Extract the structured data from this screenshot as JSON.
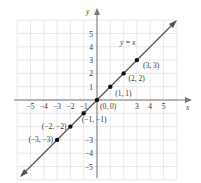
{
  "chart_data": {
    "type": "line",
    "title": "",
    "equation_label": "y = x",
    "xlabel": "x",
    "ylabel": "y",
    "xlim": [
      -6,
      6
    ],
    "ylim": [
      -6,
      6
    ],
    "grid": true,
    "x_ticks": [
      "-5",
      "-4",
      "-3",
      "-2",
      "-1",
      "3",
      "4",
      "5"
    ],
    "y_ticks": [
      "5",
      "4",
      "3",
      "2",
      "1",
      "-3",
      "-4",
      "-5"
    ],
    "series": [
      {
        "name": "y = x",
        "x": [
          -3,
          -2,
          -1,
          0,
          1,
          2,
          3
        ],
        "y": [
          -3,
          -2,
          -1,
          0,
          1,
          2,
          3
        ]
      }
    ],
    "points": [
      {
        "label": "(3, 3)",
        "x": 3,
        "y": 3
      },
      {
        "label": "(2, 2)",
        "x": 2,
        "y": 2
      },
      {
        "label": "(1, 1)",
        "x": 1,
        "y": 1
      },
      {
        "label": "(0, 0)",
        "x": 0,
        "y": 0
      },
      {
        "label": "(−1, −1)",
        "x": -1,
        "y": -1
      },
      {
        "label": "(−2, −2)",
        "x": -2,
        "y": -2
      },
      {
        "label": "(−3, −3)",
        "x": -3,
        "y": -3
      }
    ]
  },
  "colors": {
    "grid": "#e4e4e4",
    "axis": "#777777",
    "line": "#555555",
    "point": "#111111"
  }
}
